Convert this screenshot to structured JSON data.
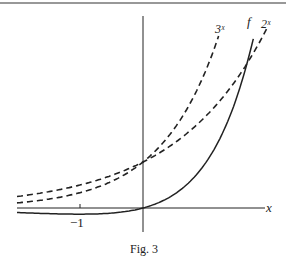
{
  "figure": {
    "caption": "Fig. 3",
    "colors": {
      "ink": "#222222",
      "background": "#ffffff"
    }
  },
  "chart_data": {
    "type": "line",
    "title": "",
    "caption": "Fig. 3",
    "xlabel": "x",
    "ylabel": "",
    "x_tick_labels": [
      "−1"
    ],
    "x_ticks": [
      -1
    ],
    "xlim": [
      -2.0,
      2.0
    ],
    "ylim": [
      -0.2,
      4.0
    ],
    "grid": false,
    "legend": "inline labels at curve ends",
    "series": [
      {
        "name": "3^x",
        "label": "3ˣ",
        "style": "dashed",
        "x": [
          -2,
          -1,
          0,
          0.5,
          1,
          1.2
        ],
        "y": [
          0.11,
          0.33,
          1,
          1.73,
          3,
          3.74
        ]
      },
      {
        "name": "2^x",
        "label": "2ˣ",
        "style": "dashed",
        "x": [
          -2,
          -1,
          0,
          1,
          1.5,
          2
        ],
        "y": [
          0.25,
          0.5,
          1,
          2,
          2.83,
          4
        ]
      },
      {
        "name": "f",
        "label": "f",
        "style": "solid",
        "x": [
          -2,
          -1,
          0,
          0.5,
          1,
          1.65,
          1.75
        ],
        "y": [
          -0.1,
          -0.13,
          0,
          0.3,
          0.99,
          3.14,
          3.6
        ]
      }
    ],
    "annotations": [
      "dashed curves 2^x and 3^x intersect at (0,1)",
      "f passes through origin and crosses 2^x near x≈1.65"
    ]
  }
}
